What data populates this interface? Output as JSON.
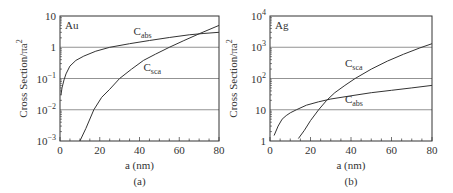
{
  "chart_data": [
    {
      "type": "line",
      "panel_label": "(a)",
      "title": "Au",
      "xlabel": "a (nm)",
      "ylabel": "Cross Section/πa²",
      "yscale": "log",
      "xlim": [
        0,
        80
      ],
      "ylim": [
        0.001,
        10
      ],
      "xticks": [
        "0",
        "20",
        "40",
        "60",
        "80"
      ],
      "yticks": [
        "10⁻³",
        "10⁻²",
        "10⁻¹",
        "1",
        "10"
      ],
      "grid": "horizontal at decades",
      "series": [
        {
          "name": "C_abs",
          "label": "C",
          "sub": "abs",
          "x": [
            0.5,
            1,
            2,
            3,
            5,
            8,
            12,
            18,
            25,
            35,
            45,
            55,
            65,
            72,
            80
          ],
          "y": [
            0.03,
            0.05,
            0.09,
            0.14,
            0.25,
            0.38,
            0.52,
            0.75,
            1.0,
            1.3,
            1.65,
            2.05,
            2.5,
            2.75,
            3.0
          ]
        },
        {
          "name": "C_sca",
          "label": "C",
          "sub": "sca",
          "x": [
            10,
            13,
            17,
            21,
            25,
            30,
            36,
            42,
            48,
            55,
            62,
            70,
            80
          ],
          "y": [
            0.001,
            0.0025,
            0.01,
            0.025,
            0.045,
            0.1,
            0.2,
            0.38,
            0.6,
            1.0,
            1.6,
            2.7,
            5.0
          ]
        }
      ]
    },
    {
      "type": "line",
      "panel_label": "(b)",
      "title": "Ag",
      "xlabel": "a (nm)",
      "ylabel": "Cross Section/πa²",
      "yscale": "log",
      "xlim": [
        0,
        80
      ],
      "ylim": [
        1,
        10000
      ],
      "xticks": [
        "0",
        "20",
        "40",
        "60",
        "80"
      ],
      "yticks": [
        "1",
        "10",
        "10²",
        "10³",
        "10⁴"
      ],
      "grid": "horizontal at decades",
      "series": [
        {
          "name": "C_sca",
          "label": "C",
          "sub": "sca",
          "x": [
            14,
            17,
            20,
            24,
            28,
            32,
            37,
            42,
            50,
            58,
            66,
            74,
            80
          ],
          "y": [
            1.2,
            2.2,
            4.5,
            10,
            20,
            35,
            60,
            100,
            200,
            360,
            600,
            950,
            1300
          ]
        },
        {
          "name": "C_abs",
          "label": "C",
          "sub": "abs",
          "x": [
            2,
            4,
            6,
            8,
            10,
            13,
            18,
            24,
            30,
            40,
            50,
            60,
            70,
            80
          ],
          "y": [
            1.5,
            3,
            5,
            6.5,
            8,
            10,
            14,
            18,
            22,
            28,
            35,
            42,
            50,
            60
          ]
        }
      ]
    }
  ]
}
